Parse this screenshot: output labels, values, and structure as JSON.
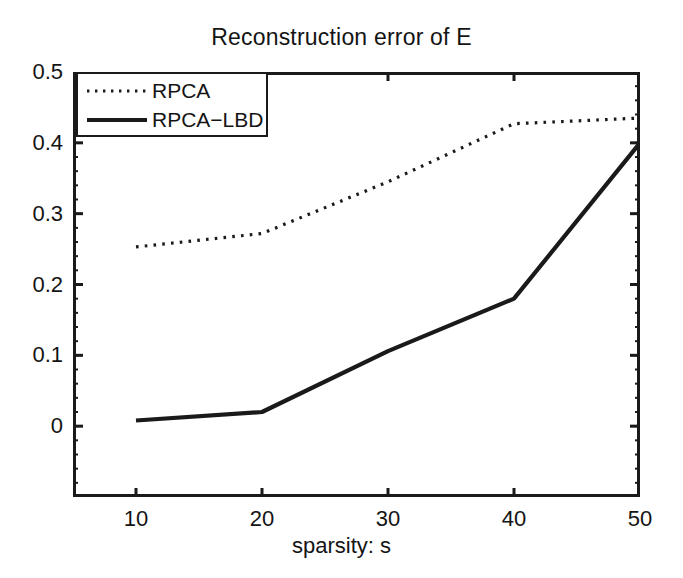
{
  "chart_data": {
    "type": "line",
    "title": "Reconstruction error of E",
    "xlabel": "sparsity: s",
    "ylabel": "",
    "x": [
      10,
      20,
      30,
      40,
      50
    ],
    "xlim": [
      5,
      50
    ],
    "ylim": [
      -0.1,
      0.5
    ],
    "xticks": [
      "10",
      "20",
      "30",
      "40",
      "50"
    ],
    "yticks": [
      "0",
      "0.1",
      "0.2",
      "0.3",
      "0.4",
      "0.5"
    ],
    "ytick_values": [
      0,
      0.1,
      0.2,
      0.3,
      0.4,
      0.5
    ],
    "grid": false,
    "legend_position": "top-left",
    "series": [
      {
        "name": "RPCA",
        "style": "dotted",
        "color": "#1a1a1a",
        "values": [
          0.253,
          0.272,
          0.345,
          0.427,
          0.435
        ]
      },
      {
        "name": "RPCA−LBD",
        "style": "solid",
        "color": "#1a1a1a",
        "values": [
          0.008,
          0.02,
          0.106,
          0.18,
          0.4
        ]
      }
    ]
  },
  "legend": {
    "entries": [
      {
        "label": "RPCA"
      },
      {
        "label": "RPCA−LBD"
      }
    ]
  },
  "colors": {
    "background": "#ffffff",
    "axis": "#1a1a1a",
    "text": "#141414"
  }
}
